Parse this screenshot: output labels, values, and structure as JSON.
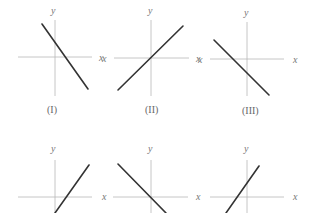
{
  "figure": {
    "colors": {
      "axis": "#b8b8b8",
      "line": "#333333",
      "text": "#777777"
    },
    "graphs": [
      {
        "id": "I",
        "caption": "(I)",
        "x_label": "x",
        "y_label": "y",
        "slope": "negative",
        "x_intercept": "positive",
        "y_intercept": "positive"
      },
      {
        "id": "II",
        "caption": "(II)",
        "x_label": "x",
        "y_label": "y",
        "x_label_left": "x",
        "slope": "positive",
        "passes_through_origin": true
      },
      {
        "id": "III",
        "caption": "(III)",
        "x_label": "x",
        "y_label": "y",
        "x_label_left": "x",
        "slope": "negative",
        "x_intercept": "negative",
        "y_intercept": "negative"
      },
      {
        "id": "IV",
        "caption": "",
        "x_label": "x",
        "y_label": "y",
        "slope": "positive",
        "x_intercept": "positive",
        "y_intercept": "negative"
      },
      {
        "id": "V",
        "caption": "",
        "x_label": "x",
        "y_label": "y",
        "slope": "negative",
        "passes_through_origin": true
      },
      {
        "id": "VI",
        "caption": "",
        "x_label": "x",
        "y_label": "y",
        "slope": "positive",
        "x_intercept": "negative",
        "y_intercept": "positive"
      }
    ]
  }
}
